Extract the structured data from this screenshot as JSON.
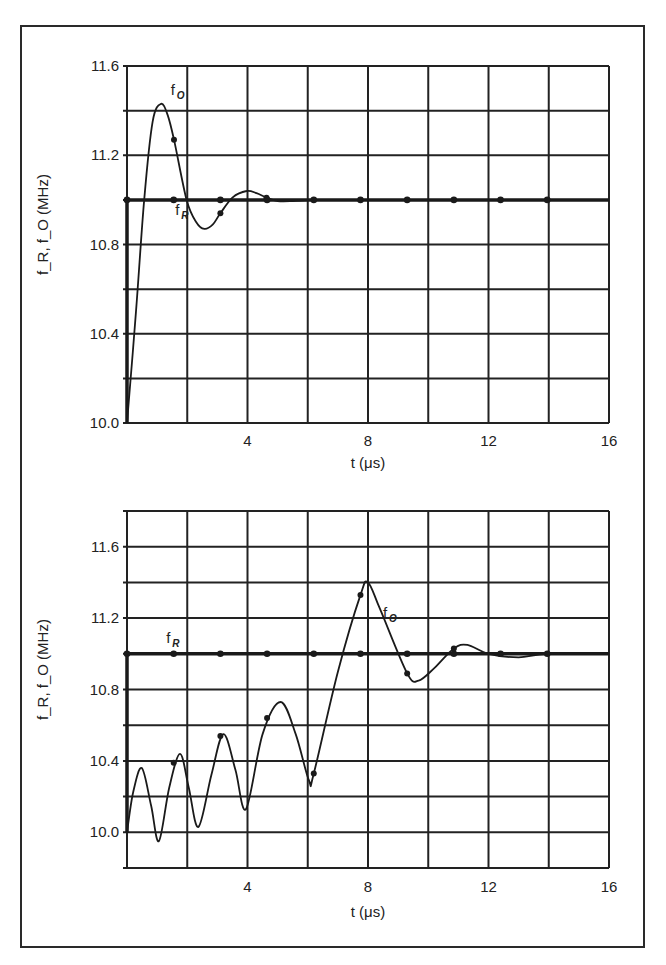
{
  "figure": {
    "frame": true
  },
  "chart_data": [
    {
      "type": "line",
      "title": "",
      "xlabel": "t (μs)",
      "ylabel": "f_R, f_O (MHz)",
      "xlim": [
        0,
        16
      ],
      "ylim": [
        10.0,
        11.6
      ],
      "x_ticks": [
        4,
        8,
        12,
        16
      ],
      "x_tick_labels": [
        "4",
        "8",
        "12",
        "16"
      ],
      "y_ticks": [
        10.0,
        10.4,
        10.8,
        11.2,
        11.6
      ],
      "y_tick_labels": [
        "10.0",
        "10.4",
        "10.8",
        "11.2",
        "11.6"
      ],
      "grid": {
        "x_step": 2,
        "y_step": 0.2
      },
      "series": [
        {
          "name": "f_R",
          "label": "f",
          "label_sub": "R",
          "style": "thick-line-with-dots",
          "x": [
            0,
            0,
            16
          ],
          "y": [
            10.0,
            11.0,
            11.0
          ],
          "marker_x": [
            0,
            1.55,
            3.1,
            4.65,
            6.2,
            7.75,
            9.3,
            10.85,
            12.4,
            13.95
          ],
          "marker_y": [
            11.0,
            11.0,
            11.0,
            11.0,
            11.0,
            11.0,
            11.0,
            11.0,
            11.0,
            11.0
          ],
          "label_pos": {
            "t": 1.6,
            "f": 10.93
          }
        },
        {
          "name": "f_O",
          "label": "f",
          "label_sub": "O",
          "style": "smooth-line",
          "x": [
            0,
            0.3,
            0.57,
            0.85,
            1.13,
            1.35,
            1.56,
            1.98,
            2.3,
            2.57,
            2.85,
            3.1,
            3.5,
            3.97,
            4.3,
            4.63,
            5.0,
            5.5,
            6.2,
            7.0,
            16
          ],
          "y": [
            10.0,
            10.5,
            11.0,
            11.35,
            11.43,
            11.38,
            11.27,
            11.0,
            10.9,
            10.87,
            10.89,
            10.94,
            11.01,
            11.04,
            11.03,
            11.01,
            10.995,
            10.995,
            11.0,
            11.0,
            11.0
          ],
          "marker_x": [
            1.56,
            3.1,
            4.63
          ],
          "marker_y": [
            11.27,
            10.94,
            11.01
          ],
          "label_pos": {
            "t": 1.45,
            "f": 11.47
          }
        }
      ]
    },
    {
      "type": "line",
      "title": "",
      "xlabel": "t (μs)",
      "ylabel": "f_R, f_O (MHz)",
      "xlim": [
        0,
        16
      ],
      "ylim": [
        9.8,
        11.8
      ],
      "x_ticks": [
        4,
        8,
        12,
        16
      ],
      "x_tick_labels": [
        "4",
        "8",
        "12",
        "16"
      ],
      "y_ticks": [
        10.0,
        10.4,
        10.8,
        11.2,
        11.6
      ],
      "y_tick_labels": [
        "10.0",
        "10.4",
        "10.8",
        "11.2",
        "11.6"
      ],
      "grid": {
        "x_step": 2,
        "y_step": 0.2
      },
      "series": [
        {
          "name": "f_R",
          "label": "f",
          "label_sub": "R",
          "style": "thick-line-with-dots",
          "x": [
            0,
            0,
            16
          ],
          "y": [
            10.0,
            11.0,
            11.0
          ],
          "marker_x": [
            0,
            1.55,
            3.1,
            4.65,
            6.2,
            7.75,
            9.3,
            10.85,
            12.4,
            13.95
          ],
          "marker_y": [
            11.0,
            11.0,
            11.0,
            11.0,
            11.0,
            11.0,
            11.0,
            11.0,
            11.0,
            11.0
          ],
          "label_pos": {
            "t": 1.3,
            "f": 11.06
          }
        },
        {
          "name": "f_O",
          "label": "f",
          "label_sub": "O",
          "style": "smooth-line",
          "x": [
            0,
            0.2,
            0.49,
            0.8,
            1.06,
            1.4,
            1.76,
            2.05,
            2.37,
            2.8,
            3.2,
            3.6,
            3.95,
            4.5,
            5.1,
            5.6,
            6.04,
            6.2,
            7.0,
            7.75,
            8.0,
            8.4,
            9.3,
            9.68,
            10.2,
            10.85,
            11.3,
            12.0,
            13.0,
            13.95,
            16
          ],
          "y": [
            10.0,
            10.22,
            10.36,
            10.15,
            9.95,
            10.25,
            10.44,
            10.25,
            10.03,
            10.32,
            10.55,
            10.35,
            10.13,
            10.55,
            10.73,
            10.55,
            10.29,
            10.33,
            10.9,
            11.33,
            11.4,
            11.25,
            10.89,
            10.85,
            10.92,
            11.03,
            11.05,
            11.0,
            10.98,
            11.0,
            11.0
          ],
          "marker_x": [
            1.55,
            3.1,
            4.65,
            6.2,
            7.75,
            9.3,
            10.85
          ],
          "marker_y": [
            10.39,
            10.54,
            10.64,
            10.33,
            11.33,
            10.89,
            11.03
          ],
          "label_pos": {
            "t": 8.5,
            "f": 11.2
          }
        }
      ]
    }
  ],
  "charts": [
    {
      "y_axis_label": "f_R, f_O (MHz)",
      "x_axis_label": "t (μs)"
    },
    {
      "y_axis_label": "f_R, f_O (MHz)",
      "x_axis_label": "t (μs)"
    }
  ]
}
